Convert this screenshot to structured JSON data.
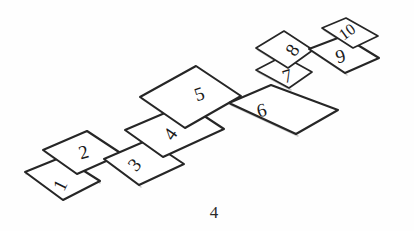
{
  "figure": {
    "caption": "4",
    "background_color": "#fefefe",
    "ink_color": "#262626",
    "shadow_color": "#9a9a9a"
  },
  "court": {
    "style": "hand-drawn pencil sketch",
    "square_count": 10,
    "squares": [
      {
        "number": "1",
        "label_x": 62,
        "label_y": 186,
        "label_rotation": -64,
        "points": "25,172 62,157 100,181 63,200"
      },
      {
        "number": "2",
        "label_x": 84,
        "label_y": 154,
        "label_rotation": -16,
        "points": "43,150 87,131 122,154 77,174"
      },
      {
        "number": "3",
        "label_x": 136,
        "label_y": 166,
        "label_rotation": -48,
        "points": "104,159 148,140 184,164 139,185"
      },
      {
        "number": "4",
        "label_x": 172,
        "label_y": 135,
        "label_rotation": -55,
        "points": "125,130 186,104 224,129 163,157"
      },
      {
        "number": "5",
        "label_x": 200,
        "label_y": 96,
        "label_rotation": -18,
        "points": "140,97 196,66 241,96 185,128"
      },
      {
        "number": "6",
        "label_x": 262,
        "label_y": 112,
        "label_rotation": -14,
        "points": "229,103 271,85 338,110 296,134"
      },
      {
        "number": "7",
        "label_x": 288,
        "label_y": 78,
        "label_rotation": -18,
        "points": "256,70 283,56 312,72 289,88"
      },
      {
        "number": "8",
        "label_x": 294,
        "label_y": 51,
        "label_rotation": -56,
        "points": "256,48 284,31 313,50 288,68"
      },
      {
        "number": "9",
        "label_x": 341,
        "label_y": 58,
        "label_rotation": -15,
        "points": "309,49 343,36 379,58 345,73"
      },
      {
        "number": "10",
        "label_x": 348,
        "label_y": 33,
        "label_rotation": -36,
        "points": "322,28 346,18 378,36 353,48"
      }
    ],
    "shadows": [
      "26,174 L 62,159 L 100,183",
      "45,152 L 78,176",
      "106,161 L 141,187",
      "128,132 L 165,159",
      "142,99 L 187,130",
      "231,105 L 298,136",
      "258,72 L 291,90",
      "258,50 L 290,70",
      "311,51 L 347,75",
      "324,30 L 355,50"
    ]
  }
}
